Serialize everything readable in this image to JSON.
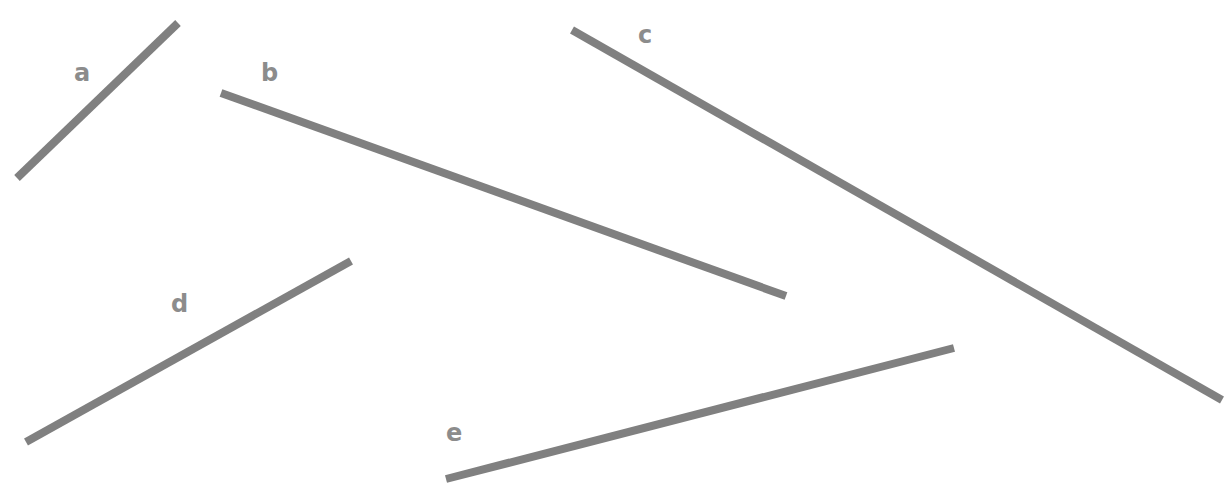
{
  "diagram": {
    "line_color": "#808080",
    "label_color": "#8c8c8c",
    "segments": [
      {
        "id": "a",
        "label": "a",
        "orientation": "rising to the right"
      },
      {
        "id": "b",
        "label": "b",
        "orientation": "falling to the right"
      },
      {
        "id": "c",
        "label": "c",
        "orientation": "falling to the right"
      },
      {
        "id": "d",
        "label": "d",
        "orientation": "rising to the right"
      },
      {
        "id": "e",
        "label": "e",
        "orientation": "rising to the right"
      }
    ]
  }
}
